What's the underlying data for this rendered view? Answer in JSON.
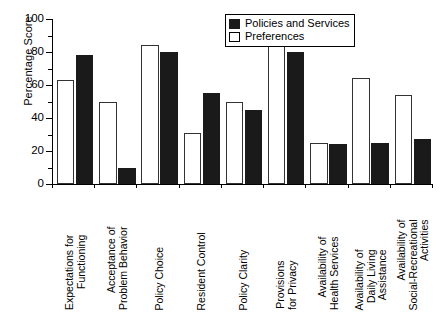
{
  "chart_data": {
    "type": "bar",
    "title": "",
    "xlabel": "",
    "ylabel": "Percentage Score",
    "ylim": [
      0,
      100
    ],
    "ytick_labels": [
      "0",
      "20",
      "40",
      "60",
      "80",
      "100"
    ],
    "ytick_values": [
      0,
      20,
      40,
      60,
      80,
      100
    ],
    "yminor_values": [
      10,
      30,
      50,
      70,
      90
    ],
    "grid": false,
    "legend_position": "top-right",
    "categories": [
      "Expectations for Functioning",
      "Acceptance of Problem Behavior",
      "Policy Choice",
      "Resident Control",
      "Policy Clarity",
      "Provisions for Privacy",
      "Availability of Health Services",
      "Availability of Daily Living Assistance",
      "Availability of Social-Recreational Activities"
    ],
    "category_lines": [
      [
        "Expectations for",
        "Functioning"
      ],
      [
        "Acceptance of",
        "Problem Behavior"
      ],
      [
        "Policy Choice"
      ],
      [
        "Resident Control"
      ],
      [
        "Policy Clarity"
      ],
      [
        "Provisions",
        "for Privacy"
      ],
      [
        "Availability of",
        "Health Services"
      ],
      [
        "Availability of",
        "Daily Living",
        "Assistance"
      ],
      [
        "Availability of",
        "Social-Recreational",
        "Activities"
      ]
    ],
    "series": [
      {
        "name": "Preferences",
        "style": "open",
        "color": "#ffffff",
        "values": [
          63,
          50,
          84,
          31,
          50,
          90,
          25,
          64,
          54
        ]
      },
      {
        "name": "Policies and Services",
        "style": "filled",
        "color": "#1a1a1a",
        "values": [
          78,
          10,
          80,
          55,
          45,
          80,
          24,
          25,
          27
        ]
      }
    ]
  },
  "legend": {
    "items": [
      {
        "label": "Policies and Services",
        "style": "filled"
      },
      {
        "label": "Preferences",
        "style": "open"
      }
    ]
  }
}
